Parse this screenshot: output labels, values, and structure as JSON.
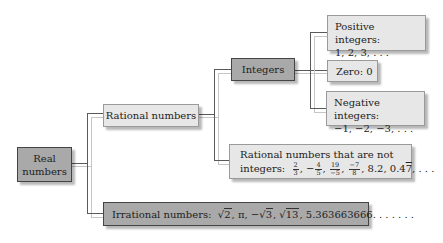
{
  "diagram": {
    "colors": {
      "dark_box": "#a9a9a9",
      "light_box": "#e7e7e7",
      "line_dark": "#5a5a5a",
      "line_light": "#c6c6c6"
    },
    "nodes": {
      "real": {
        "label_line1": "Real",
        "label_line2": "numbers"
      },
      "rational": {
        "label": "Rational numbers"
      },
      "integers": {
        "label": "Integers"
      },
      "positive": {
        "label": "Positive integers:",
        "examples": "1, 2, 3, . . ."
      },
      "zero": {
        "label": "Zero: 0"
      },
      "negative": {
        "label": "Negative integers:",
        "examples": "−1, −2, −3, . . ."
      },
      "non_integer_rational": {
        "label_line1": "Rational numbers that are not",
        "label_prefix": "integers:",
        "fractions": [
          {
            "sign": "",
            "num": "2",
            "den": "3"
          },
          {
            "sign": "−",
            "num": "4",
            "den": "5"
          },
          {
            "sign": "",
            "num": "19",
            "den": "−5"
          },
          {
            "sign": "",
            "num": "−7",
            "den": "8"
          }
        ],
        "decimal1": "8.2",
        "decimal2_base": "0.4",
        "decimal2_repeat": "7",
        "ellipsis": ". . ."
      },
      "irrational": {
        "label": "Irrational numbers:",
        "ex1": "2",
        "ex2": "π",
        "ex3": "3",
        "ex4": "13",
        "ex5": "5.363663666. . . . . . ."
      }
    },
    "edges": [
      [
        "real",
        "rational"
      ],
      [
        "real",
        "irrational"
      ],
      [
        "rational",
        "integers"
      ],
      [
        "rational",
        "non_integer_rational"
      ],
      [
        "integers",
        "positive"
      ],
      [
        "integers",
        "zero"
      ],
      [
        "integers",
        "negative"
      ]
    ]
  }
}
